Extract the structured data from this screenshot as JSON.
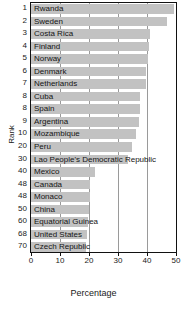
{
  "chart_data": {
    "type": "bar",
    "orientation": "horizontal",
    "title": "",
    "xlabel": "Percentage",
    "ylabel": "Rank",
    "xlim": [
      0,
      50
    ],
    "xticks": [
      0,
      10,
      20,
      30,
      40,
      50
    ],
    "xtick_labels": [
      "0",
      "10",
      "20",
      "30",
      "40",
      "50"
    ],
    "grid": true,
    "grid_axis": "x",
    "legend": "none",
    "bar_color": "#c2c2c2",
    "categories": [
      "Rwanda",
      "Sweden",
      "Costa Rica",
      "Finland",
      "Norway",
      "Denmark",
      "Netherlands",
      "Cuba",
      "Spain",
      "Argentina",
      "Mozambique",
      "Peru",
      "Lao People's Democratic Republic",
      "Mexico",
      "Canada",
      "Monaco",
      "China",
      "Equatorial Guinea",
      "United States",
      "Czech Republic"
    ],
    "ranks": [
      "1",
      "2",
      "3",
      "4",
      "5",
      "6",
      "7",
      "8",
      "8",
      "9",
      "10",
      "20",
      "30",
      "40",
      "48",
      "48",
      "50",
      "60",
      "68",
      "70"
    ],
    "values": [
      49.3,
      47.0,
      41.0,
      40.8,
      40.3,
      39.7,
      39.5,
      37.6,
      37.6,
      37.3,
      36.2,
      34.8,
      33.5,
      22.0,
      20.5,
      20.5,
      20.0,
      19.5,
      19.2,
      19.0
    ]
  }
}
